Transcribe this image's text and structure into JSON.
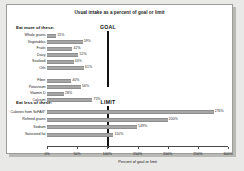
{
  "chart_data": {
    "type": "bar",
    "orientation": "horizontal",
    "title": "Usual intake as a percent of goal or limit",
    "xlabel": "Percent of goal or limit",
    "ylabel": "",
    "xlim": [
      0,
      300
    ],
    "grid": false,
    "legend": null,
    "tick_labels": [
      "0%",
      "50%",
      "100%",
      "150%",
      "200%",
      "250%",
      "300%"
    ],
    "tick_values": [
      0,
      50,
      100,
      150,
      200,
      250,
      300
    ],
    "reference_lines": [
      {
        "name": "goal",
        "label": "GOAL",
        "value": 100
      },
      {
        "name": "limit",
        "label": "LIMIT",
        "value": 100
      }
    ],
    "groups": [
      {
        "name": "eat-more",
        "heading": "Eat more of these:",
        "reference": "GOAL",
        "categories": [
          "Whole grains",
          "Vegetables",
          "Fruits",
          "Dairy",
          "Seafood",
          "Oils",
          "Fiber",
          "Potassium",
          "Vitamin D",
          "Calcium"
        ],
        "values": [
          15,
          59,
          42,
          52,
          44,
          61,
          40,
          56,
          28,
          75
        ],
        "value_labels": [
          "15%",
          "59%",
          "42%",
          "52%",
          "44%",
          "61%",
          "40%",
          "56%",
          "28%",
          "75%"
        ]
      },
      {
        "name": "eat-less",
        "heading": "Eat less of these:",
        "reference": "LIMIT",
        "categories": [
          "Calories from SoFAS*",
          "Refined grains",
          "Sodium",
          "Saturated fat"
        ],
        "values": [
          276,
          200,
          149,
          110
        ],
        "value_labels": [
          "276%",
          "200%",
          "149%",
          "110%"
        ]
      }
    ]
  }
}
